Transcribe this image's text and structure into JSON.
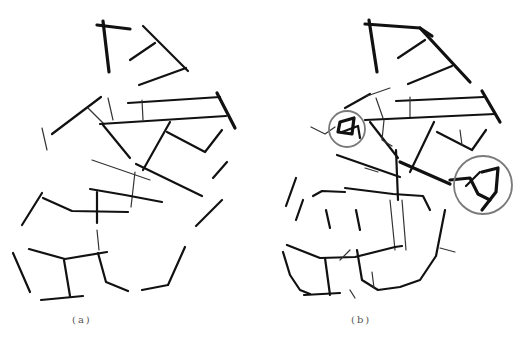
{
  "figure": {
    "panels": [
      {
        "id": "a",
        "caption": "(a)",
        "description": "extracted line network, original"
      },
      {
        "id": "b",
        "caption": "(b)",
        "description": "extracted line network with highlighted regions"
      }
    ],
    "highlights": [
      {
        "panel": "b",
        "shape": "circle",
        "cx": 347,
        "cy": 129,
        "r": 18,
        "color": "#7a7a7a"
      },
      {
        "panel": "b",
        "shape": "circle",
        "cx": 483,
        "cy": 185,
        "r": 29,
        "color": "#7a7a7a"
      }
    ],
    "stroke_color": "#111111",
    "background": "#ffffff"
  }
}
